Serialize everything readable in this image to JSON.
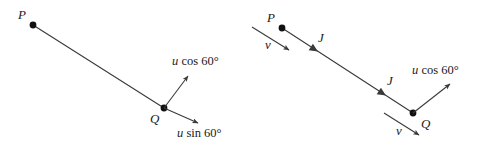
{
  "figure": {
    "background_color": "#ffffff",
    "stroke_color": "#3a3a3a",
    "text_color": "#1a1a1a",
    "width": 485,
    "height": 148
  },
  "left_diagram": {
    "name": "left-panel",
    "rod": {
      "from": {
        "x": 33,
        "y": 25
      },
      "to": {
        "x": 164,
        "y": 108
      }
    },
    "points": [
      {
        "id": "P",
        "label": "P",
        "x": 33,
        "y": 25,
        "label_x": 18,
        "label_y": 8
      },
      {
        "id": "Q",
        "label": "Q",
        "x": 164,
        "y": 108,
        "label_x": 150,
        "label_y": 112
      }
    ],
    "vectors": [
      {
        "id": "u-cos-60",
        "label": "u cos 60°",
        "variable": "u",
        "expression": " cos 60°",
        "from": {
          "x": 164,
          "y": 108
        },
        "to": {
          "x": 188,
          "y": 76
        },
        "label_x": 172,
        "label_y": 55
      },
      {
        "id": "u-sin-60",
        "label": "u sin 60°",
        "variable": "u",
        "expression": " sin 60°",
        "from": {
          "x": 164,
          "y": 108
        },
        "to": {
          "x": 198,
          "y": 123
        },
        "label_x": 177,
        "label_y": 127
      }
    ]
  },
  "right_diagram": {
    "name": "right-panel",
    "rod": {
      "from": {
        "x": 282,
        "y": 28
      },
      "to": {
        "x": 413,
        "y": 113
      }
    },
    "points": [
      {
        "id": "P",
        "label": "P",
        "x": 282,
        "y": 28,
        "label_x": 267,
        "label_y": 11
      },
      {
        "id": "Q",
        "label": "Q",
        "x": 413,
        "y": 113,
        "label_x": 421,
        "label_y": 117
      }
    ],
    "impulse_markers": [
      {
        "id": "J-upper",
        "label": "J",
        "arrow_x": 314,
        "arrow_y": 49,
        "label_x": 318,
        "label_y": 31
      },
      {
        "id": "J-lower",
        "label": "J",
        "arrow_x": 382,
        "arrow_y": 93,
        "label_x": 387,
        "label_y": 74
      }
    ],
    "velocity_vectors": [
      {
        "id": "v-at-P",
        "label": "v",
        "from": {
          "x": 252,
          "y": 27
        },
        "to": {
          "x": 289,
          "y": 50
        },
        "label_x": 265,
        "label_y": 38
      },
      {
        "id": "v-at-Q",
        "label": "v",
        "from": {
          "x": 384,
          "y": 113
        },
        "to": {
          "x": 419,
          "y": 135
        },
        "label_x": 396,
        "label_y": 124
      }
    ],
    "vectors": [
      {
        "id": "u-cos-60",
        "label": "u cos 60°",
        "variable": "u",
        "expression": " cos 60°",
        "from": {
          "x": 413,
          "y": 113
        },
        "to": {
          "x": 450,
          "y": 84
        },
        "label_x": 412,
        "label_y": 64
      }
    ]
  }
}
